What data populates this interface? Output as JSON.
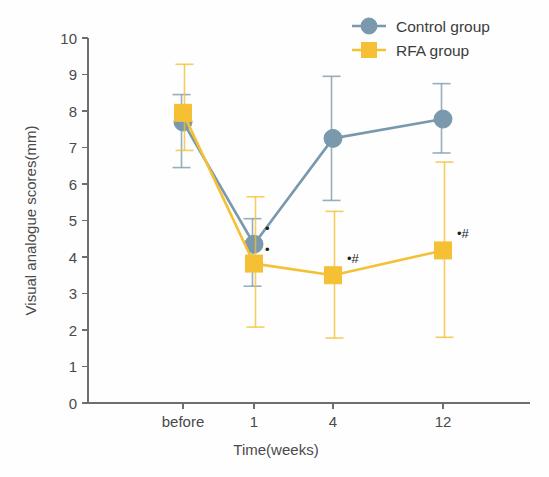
{
  "figure": {
    "width": 549,
    "height": 477,
    "background": "#fefefe"
  },
  "legend": {
    "position": "top-right",
    "entries": [
      {
        "label": "Control group",
        "color": "#7b99ad",
        "marker": "circle",
        "marker_name": "legend-marker-circle"
      },
      {
        "label": "RFA group",
        "color": "#f5c033",
        "marker": "square",
        "marker_name": "legend-marker-square"
      }
    ]
  },
  "axes": {
    "y_label": "Visual analogue scores(mm)",
    "x_label": "Time(weeks)",
    "y_ticks": [
      "10",
      "9",
      "8",
      "7",
      "6",
      "5",
      "4",
      "3",
      "2",
      "1",
      "0"
    ],
    "x_ticks": [
      "before",
      "1",
      "4",
      "12"
    ]
  },
  "annotations": [
    {
      "text": "•",
      "series": "Control group",
      "x": "1",
      "name": "sig-dot-control-week1"
    },
    {
      "text": "•",
      "series": "RFA group",
      "x": "1",
      "name": "sig-dot-rfa-week1"
    },
    {
      "text": "•#",
      "series": "RFA group",
      "x": "4",
      "name": "sig-dot-hash-rfa-week4"
    },
    {
      "text": "•#",
      "series": "RFA group",
      "x": "12",
      "name": "sig-dot-hash-rfa-week12"
    }
  ],
  "chart_data": {
    "type": "line",
    "title": "",
    "subtitle": "",
    "xlabel": "Time(weeks)",
    "ylabel": "Visual analogue scores(mm)",
    "categories": [
      "before",
      "1",
      "4",
      "12"
    ],
    "ylim": [
      0,
      10
    ],
    "ytick_step": 1,
    "grid": false,
    "legend_position": "top-right",
    "error_bars": true,
    "series": [
      {
        "name": "Control group",
        "color": "#7b99ad",
        "marker": "circle",
        "values": [
          7.7,
          4.35,
          7.25,
          7.78
        ],
        "err_low": [
          6.45,
          3.2,
          5.55,
          6.85
        ],
        "err_high": [
          8.45,
          5.05,
          8.95,
          8.75
        ]
      },
      {
        "name": "RFA group",
        "color": "#f5c033",
        "marker": "square",
        "values": [
          7.95,
          3.82,
          3.5,
          4.18
        ],
        "err_low": [
          6.92,
          2.08,
          1.78,
          1.8
        ],
        "err_high": [
          9.28,
          5.65,
          5.25,
          6.6
        ]
      }
    ]
  }
}
